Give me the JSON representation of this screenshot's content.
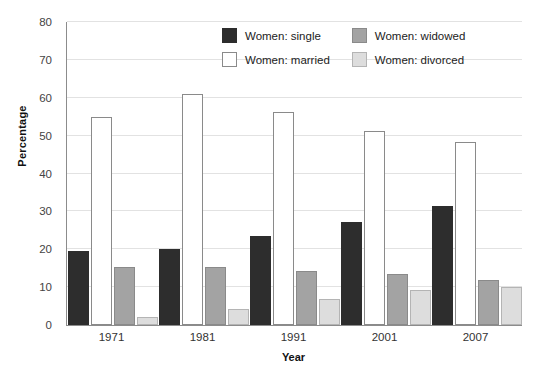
{
  "chart_data": {
    "type": "bar",
    "title": "",
    "xlabel": "Year",
    "ylabel": "Percentage",
    "categories": [
      "1971",
      "1981",
      "1991",
      "2001",
      "2007"
    ],
    "ylim": [
      0,
      80
    ],
    "yticks": [
      0,
      10,
      20,
      30,
      40,
      50,
      60,
      70,
      80
    ],
    "grid": true,
    "legend_position": "top-right",
    "series": [
      {
        "name": "Women: single",
        "key": "single",
        "color": "#2d2d2d",
        "values": [
          19.5,
          20.0,
          23.5,
          27.3,
          31.5
        ]
      },
      {
        "name": "Women: married",
        "key": "married",
        "color": "#ffffff",
        "values": [
          55.0,
          61.0,
          56.2,
          51.3,
          48.3
        ]
      },
      {
        "name": "Women: widowed",
        "key": "widowed",
        "color": "#a3a3a3",
        "values": [
          15.3,
          15.3,
          14.3,
          13.6,
          11.8
        ]
      },
      {
        "name": "Women: divorced",
        "key": "divorced",
        "color": "#dddddd",
        "values": [
          2.2,
          4.3,
          7.0,
          9.2,
          10.0
        ]
      }
    ]
  },
  "legend": {
    "items": [
      {
        "label": "Women: single",
        "key": "single"
      },
      {
        "label": "Women: widowed",
        "key": "widowed"
      },
      {
        "label": "Women: married",
        "key": "married"
      },
      {
        "label": "Women: divorced",
        "key": "divorced"
      }
    ]
  }
}
